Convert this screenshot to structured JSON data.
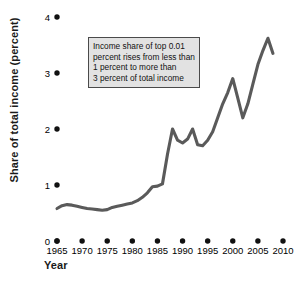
{
  "chart_data": {
    "type": "line",
    "title": "",
    "subtitle": "",
    "xlabel": "Year",
    "ylabel": "Share of total income (percent)",
    "xlim": [
      1965,
      2010
    ],
    "ylim": [
      0,
      4
    ],
    "xticks": [
      "1965",
      "1970",
      "1975",
      "1980",
      "1985",
      "1990",
      "1995",
      "2000",
      "2005",
      "2010"
    ],
    "yticks": [
      "0",
      "1",
      "2",
      "3",
      "4"
    ],
    "grid": false,
    "legend": "none",
    "line_color": "#5a5a5a",
    "series": [
      {
        "name": "Income share of top 0.01 percent",
        "x": [
          1965,
          1966,
          1967,
          1968,
          1969,
          1970,
          1971,
          1972,
          1973,
          1974,
          1975,
          1976,
          1977,
          1978,
          1979,
          1980,
          1981,
          1982,
          1983,
          1984,
          1985,
          1986,
          1987,
          1988,
          1989,
          1990,
          1991,
          1992,
          1993,
          1994,
          1995,
          1996,
          1997,
          1998,
          1999,
          2000,
          2001,
          2002,
          2003,
          2004,
          2005,
          2006,
          2007,
          2008
        ],
        "values": [
          0.58,
          0.63,
          0.65,
          0.64,
          0.62,
          0.6,
          0.58,
          0.57,
          0.56,
          0.55,
          0.56,
          0.6,
          0.62,
          0.64,
          0.66,
          0.68,
          0.72,
          0.78,
          0.86,
          0.97,
          0.98,
          1.02,
          1.55,
          2.0,
          1.8,
          1.75,
          1.82,
          2.0,
          1.72,
          1.7,
          1.8,
          1.95,
          2.2,
          2.45,
          2.65,
          2.9,
          2.55,
          2.2,
          2.45,
          2.8,
          3.15,
          3.4,
          3.62,
          3.35
        ]
      }
    ],
    "annotations": [
      {
        "name": "callout-box",
        "lines": [
          "Income share of top 0.01",
          "percent rises from less than",
          "1 percent to more than",
          "3 percent of total income"
        ]
      }
    ]
  }
}
